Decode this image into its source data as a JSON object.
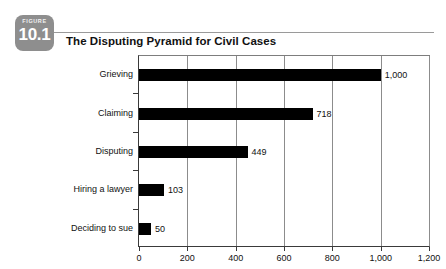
{
  "figure": {
    "kicker": "FIGURE",
    "number": "10.1",
    "badge_color": "#8e8e8e"
  },
  "chart_data": {
    "type": "bar",
    "orientation": "horizontal",
    "title": "The Disputing Pyramid for Civil Cases",
    "xlabel": "",
    "ylabel": "",
    "categories": [
      "Grieving",
      "Claiming",
      "Disputing",
      "Hiring a lawyer",
      "Deciding to sue"
    ],
    "values": [
      1000,
      718,
      449,
      103,
      50
    ],
    "value_labels": [
      "1,000",
      "718",
      "449",
      "103",
      "50"
    ],
    "xlim": [
      0,
      1200
    ],
    "xticks": [
      0,
      200,
      400,
      600,
      800,
      1000,
      1200
    ],
    "xtick_labels": [
      "0",
      "200",
      "400",
      "600",
      "800",
      "1,000",
      "1,200"
    ],
    "grid": "vertical",
    "legend": "none",
    "bar_color": "#000000"
  }
}
